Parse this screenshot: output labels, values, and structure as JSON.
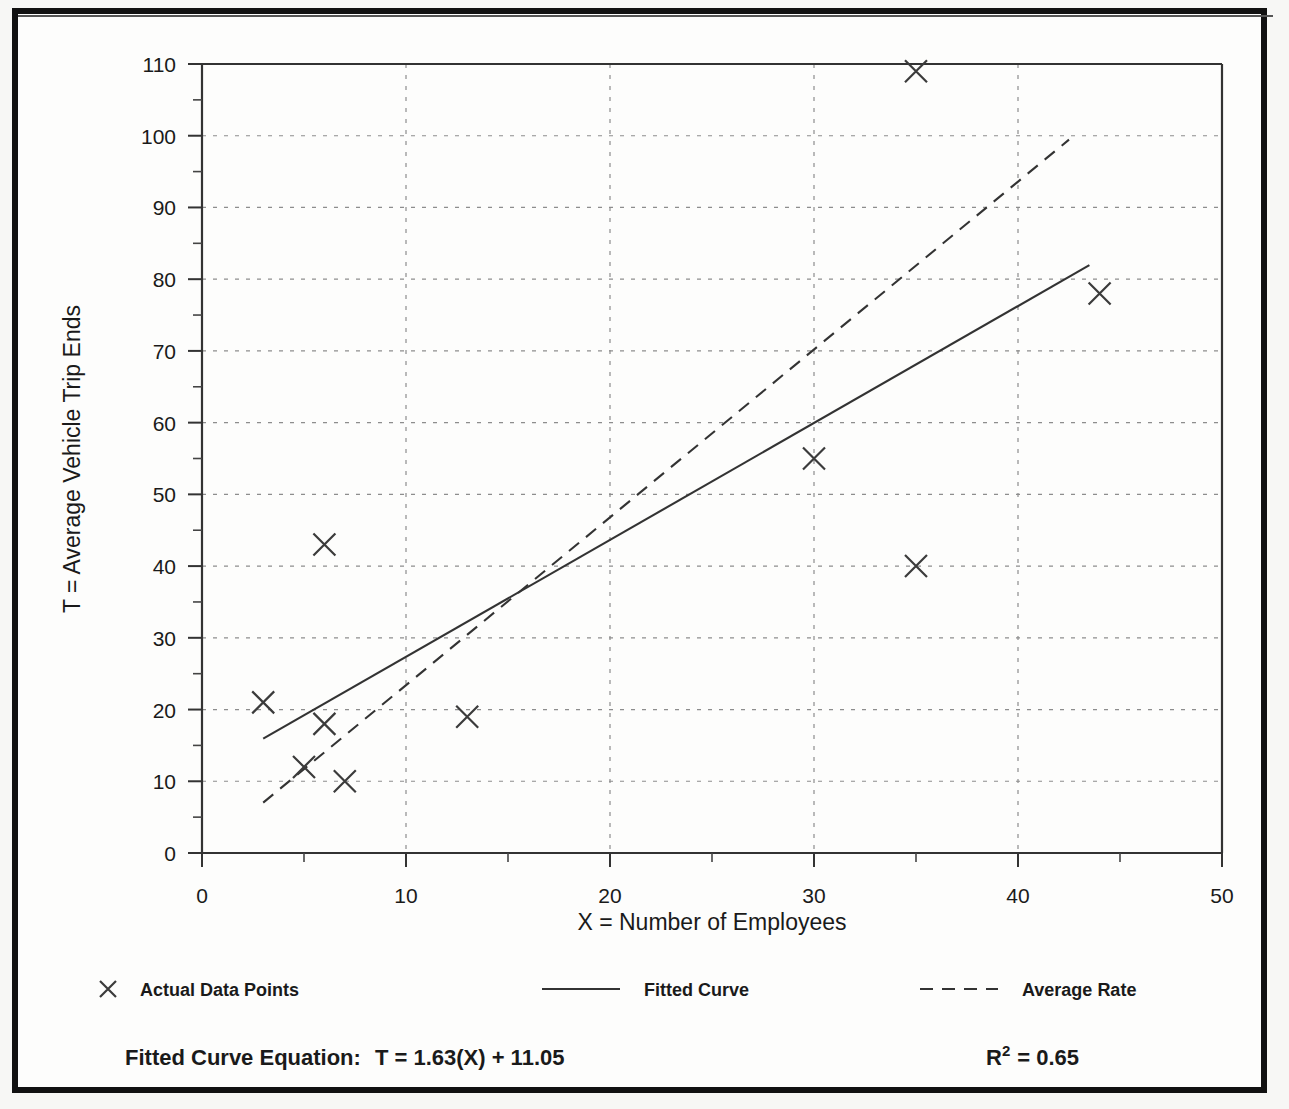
{
  "chart_data": {
    "type": "scatter",
    "title": "",
    "xlabel": "X = Number of Employees",
    "ylabel": "T = Average Vehicle Trip Ends",
    "xlim": [
      0,
      50
    ],
    "ylim": [
      0,
      110
    ],
    "x_ticks": [
      "0",
      "10",
      "20",
      "30",
      "40",
      "50"
    ],
    "x_tick_values": [
      0,
      10,
      20,
      30,
      40,
      50
    ],
    "x_minor_step": 5,
    "y_ticks": [
      "0",
      "10",
      "20",
      "30",
      "40",
      "50",
      "60",
      "70",
      "80",
      "90",
      "100",
      "110"
    ],
    "y_tick_values": [
      0,
      10,
      20,
      30,
      40,
      50,
      60,
      70,
      80,
      90,
      100,
      110
    ],
    "y_minor_step": 5,
    "grid": true,
    "grid_style": "dotted",
    "legend_position": "below-plot",
    "points": [
      {
        "x": 3,
        "y": 21
      },
      {
        "x": 5,
        "y": 12
      },
      {
        "x": 6,
        "y": 18
      },
      {
        "x": 6,
        "y": 43
      },
      {
        "x": 7,
        "y": 10
      },
      {
        "x": 13,
        "y": 19
      },
      {
        "x": 30,
        "y": 55
      },
      {
        "x": 35,
        "y": 40
      },
      {
        "x": 35,
        "y": 109
      },
      {
        "x": 44,
        "y": 78
      }
    ],
    "series": [
      {
        "name": "Actual Data Points",
        "type": "scatter",
        "marker": "x"
      },
      {
        "name": "Fitted Curve",
        "type": "line",
        "style": "solid",
        "slope": 1.63,
        "intercept": 11.05,
        "x_start": 3,
        "x_end": 43.5
      },
      {
        "name": "Average Rate",
        "type": "line",
        "style": "dashed",
        "slope": 2.34,
        "intercept": 0,
        "x_start": 3,
        "x_end": 42.5
      }
    ]
  },
  "legend": {
    "items": [
      {
        "label": "Actual Data Points",
        "marker": "x-marker"
      },
      {
        "label": "Fitted Curve",
        "marker": "solid-line"
      },
      {
        "label": "Average Rate",
        "marker": "dashed-line"
      }
    ]
  },
  "footer": {
    "equation_label": "Fitted Curve Equation:",
    "equation_value": "T = 1.63(X) + 11.05",
    "r_squared_base": "R",
    "r_squared_exponent": "2",
    "r_squared_value": "= 0.65"
  },
  "colors": {
    "frame": "#111111",
    "axis": "#333333",
    "grid": "#8d8d8d",
    "series": "#333333",
    "background": "#fdfdfc"
  }
}
